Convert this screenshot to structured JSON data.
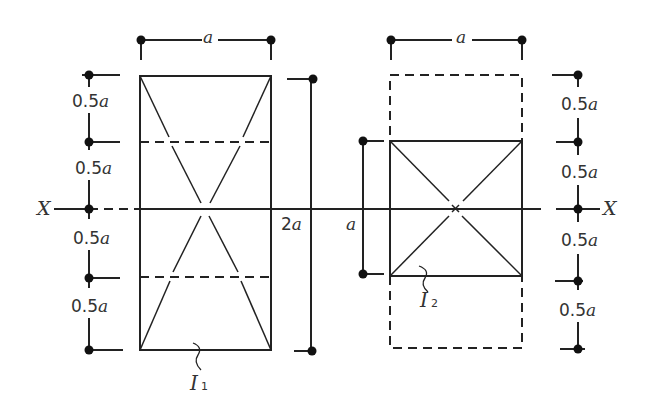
{
  "diagram": {
    "type": "cross-section comparison (second moment of area)",
    "axis": {
      "label": "X"
    },
    "shapes": [
      {
        "id": "I1",
        "label": "I",
        "subscript": "1",
        "description": "rectangle width a, height 2a, centered on X axis",
        "width_label": "a",
        "height_label": "2a",
        "segment_labels": [
          "0.5a",
          "0.5a",
          "0.5a",
          "0.5a"
        ]
      },
      {
        "id": "I2",
        "label": "I",
        "subscript": "2",
        "description": "square a × a centered on X axis, inside dashed a × 2a outline",
        "width_label": "a",
        "height_label": "a",
        "segment_labels": [
          "0.5a",
          "0.5a",
          "0.5a",
          "0.5a"
        ]
      }
    ]
  },
  "labels": {
    "top_left_a": "a",
    "top_right_a": "a",
    "left_2a_num": "2",
    "left_2a_var": "a",
    "mid_a": "a",
    "x_left": "X",
    "x_right": "X",
    "seg_num": "0.5",
    "seg_var": "a",
    "i1_main": "I",
    "i1_sub": "1",
    "i2_main": "I",
    "i2_sub": "2"
  }
}
